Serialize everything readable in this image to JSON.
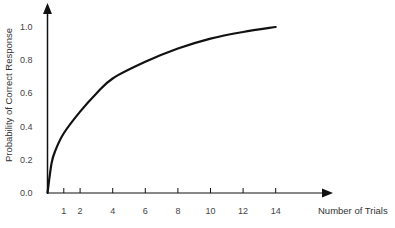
{
  "chart_data": {
    "type": "line",
    "title": "",
    "xlabel": "Number of Trials",
    "ylabel": "Probability of Correct Response",
    "x_ticks": [
      1,
      2,
      4,
      6,
      8,
      10,
      12,
      14
    ],
    "x_tick_labels": [
      "1",
      "2",
      "4",
      "6",
      "8",
      "10",
      "12",
      "14"
    ],
    "y_ticks": [
      0.0,
      0.2,
      0.4,
      0.6,
      0.8,
      1.0
    ],
    "y_tick_labels": [
      "0.0",
      "0.2",
      "0.4",
      "0.6",
      "0.8",
      "1.0"
    ],
    "xlim": [
      0,
      17.5
    ],
    "ylim": [
      0,
      1.1
    ],
    "grid": false,
    "legend": null,
    "series": [
      {
        "name": "Learning curve",
        "x": [
          0,
          0.25,
          0.5,
          1,
          2,
          3,
          4,
          6,
          8,
          10,
          12,
          14
        ],
        "values": [
          0.0,
          0.18,
          0.26,
          0.36,
          0.49,
          0.6,
          0.69,
          0.79,
          0.87,
          0.93,
          0.97,
          1.0
        ]
      }
    ],
    "colors": {
      "line": "#111111",
      "axis": "#111111",
      "text": "#444444"
    }
  }
}
